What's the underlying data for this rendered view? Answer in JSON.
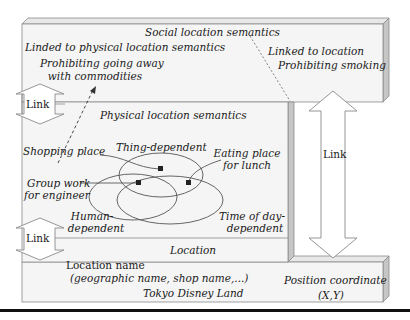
{
  "diagram": {
    "layers": {
      "social": {
        "title": "Social location semantics",
        "left_text": {
          "line1": "Linded to physical location semantics",
          "line2": "Prohibiting going away",
          "line3": "with commodities"
        },
        "right_text": {
          "line1": "Linked to location",
          "line2": "Prohibiting smoking"
        }
      },
      "physical": {
        "title": "Physical location semantics",
        "labels": {
          "shopping": "Shopping place",
          "thing": "Thing-dependent",
          "eating_1": "Eating place",
          "eating_2": "for lunch",
          "group_1": "Group work",
          "group_2": "for engineer",
          "human_1": "Human-",
          "human_2": "dependent",
          "time_1": "Time of day-",
          "time_2": "dependent"
        }
      },
      "location": {
        "title": "Location",
        "name_label": "Location name",
        "name_sub": "(geographic name, shop name,...)",
        "name_example": "Tokyo Disney Land",
        "coord_label": "Position coordinate",
        "coord_example": "(X,Y)"
      }
    },
    "links": {
      "upper_left": "Link",
      "lower_left": "Link",
      "right": "Link"
    },
    "colors": {
      "box_fill": "#f4f4f4",
      "box_side": "#c8c8c8",
      "box_top": "#e6e6e6",
      "stroke": "#888888",
      "text": "#1a1a1a",
      "rule": "#111111"
    }
  }
}
